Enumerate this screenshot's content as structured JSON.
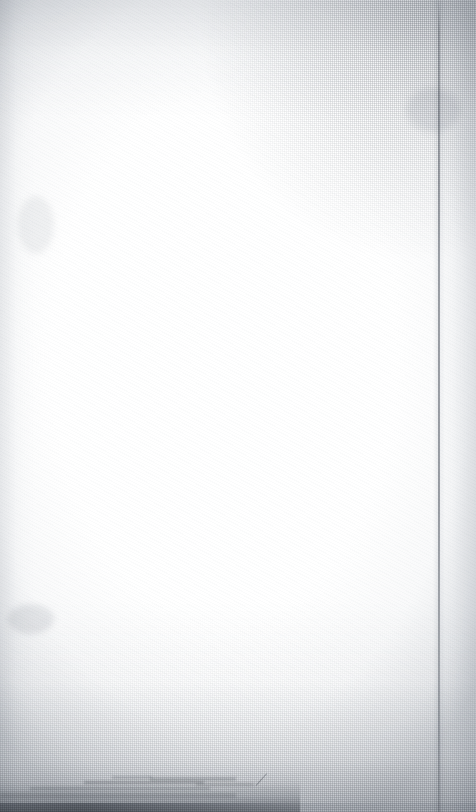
{
  "document": {
    "kind": "scanned-blank-page",
    "page_label": "",
    "body_text": "",
    "caption": "",
    "header_text": "",
    "footer_text": "",
    "page_number": ""
  },
  "canvas": {
    "width_px": 476,
    "height_px": 812
  },
  "colors": {
    "paper_white": "#ffffff",
    "paper_base": "#fdfdfd",
    "weave_thread": "#787e84",
    "vignette_edge": "#bec2c8",
    "crease_line": "#8f939a",
    "bottom_stain": "#8a8e94",
    "scan_lip": "#9ca0a6",
    "foxing": "#d6d8dc"
  },
  "features": {
    "texture_name": "woven-canvas-weave",
    "crease_name": "vertical-fold-crease",
    "crease_x_px": 438,
    "stain_name": "bottom-edge-soiling",
    "lip_name": "scan-bed-lip"
  }
}
